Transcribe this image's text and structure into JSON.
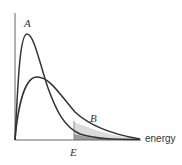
{
  "diagram": {
    "x_axis_label": "energy",
    "curve_a_label": "A",
    "curve_b_label": "B",
    "threshold_label": "E",
    "colors": {
      "curve": "#333333",
      "axis": "#555555",
      "shade_b": "#d9d9d9",
      "shade_a": "#9a9a9a"
    }
  }
}
